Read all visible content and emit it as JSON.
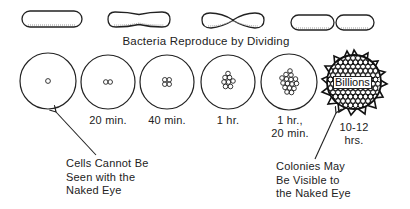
{
  "diagram": {
    "title": "Bacteria Reproduce by Dividing",
    "division_stages": [
      {
        "name": "rod-single"
      },
      {
        "name": "rod-pinching"
      },
      {
        "name": "rod-constricted"
      },
      {
        "name": "rod-divided-pair"
      }
    ],
    "growth_stages": [
      {
        "time_label": "",
        "cell_count_depicted": 1
      },
      {
        "time_label": "20 min.",
        "cell_count_depicted": 2
      },
      {
        "time_label": "40 min.",
        "cell_count_depicted": 4
      },
      {
        "time_label": "1 hr.",
        "cell_count_depicted": 8
      },
      {
        "time_label_line1": "1 hr.,",
        "time_label_line2": "20 min.",
        "cell_count_depicted": 16
      },
      {
        "time_label_line1": "10-12",
        "time_label_line2": "hrs.",
        "center_label": "Billions"
      }
    ],
    "callouts": {
      "left": "Cells Cannot Be\nSeen with the\nNaked Eye",
      "right": "Colonies May\nBe Visible to\nthe Naked Eye"
    },
    "colors": {
      "ink": "#222222",
      "background": "#ffffff"
    }
  }
}
